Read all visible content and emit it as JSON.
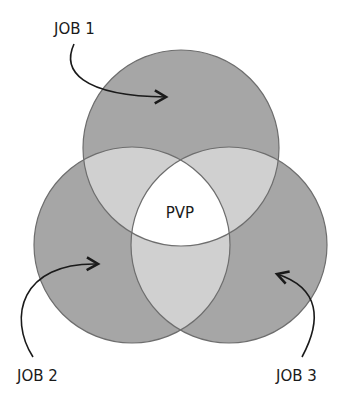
{
  "diagram": {
    "type": "venn",
    "sets": [
      {
        "label": "JOB 1",
        "position": "top"
      },
      {
        "label": "JOB 2",
        "position": "bottom-left"
      },
      {
        "label": "JOB 3",
        "position": "bottom-right"
      }
    ],
    "center_label": "PVP",
    "colors": {
      "circle_fill": "#a6a6a6",
      "pair_overlap_fill": "#d0d0d0",
      "triple_overlap_fill": "#ffffff",
      "stroke": "#6e6e6e",
      "arrow": "#1a1a1a"
    }
  }
}
